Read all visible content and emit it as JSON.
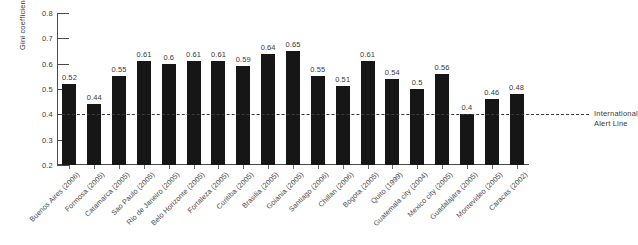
{
  "chart_data": {
    "type": "bar",
    "title": "",
    "subtitle": "",
    "xlabel": "",
    "ylabel": "Gini coefficient",
    "ylim": [
      0.2,
      0.8
    ],
    "yticks": [
      "0.8",
      "0.7",
      "0.6",
      "0.5",
      "0.4",
      "0.3",
      "0.2"
    ],
    "ytick_values": [
      0.8,
      0.7,
      0.6,
      0.5,
      0.4,
      0.3,
      0.2
    ],
    "grid": false,
    "legend": "none",
    "bar_color": "#161616",
    "categories": [
      "Buenos Aires (2006)",
      "Formosa (2005)",
      "Catamarca (2005)",
      "Sao Paulo (2005)",
      "Rio de Janeiro (2005)",
      "Belo Horizonte (2005)",
      "Fortaleza (2005)",
      "Curitiba (2005)",
      "Brasilia (2005)",
      "Goiania (2005)",
      "Santiago (2006)",
      "Chillan (2006)",
      "Bogota (2005)",
      "Quito (1999)",
      "Guatemala city (2004)",
      "Mexico city (2005)",
      "Guadalajara (2005)",
      "Montevideo (2005)",
      "Caracas (2002)"
    ],
    "values": [
      0.52,
      0.44,
      0.55,
      0.61,
      0.6,
      0.61,
      0.61,
      0.59,
      0.64,
      0.65,
      0.55,
      0.51,
      0.61,
      0.54,
      0.5,
      0.56,
      0.4,
      0.46,
      0.48
    ],
    "value_labels": [
      "0.52",
      "0.44",
      "0.55",
      "0.61",
      "0.6",
      "0.61",
      "0.61",
      "0.59",
      "0.64",
      "0.65",
      "0.55",
      "0.51",
      "0.61",
      "0.54",
      "0.5",
      "0.56",
      "0.4",
      "0.46",
      "0.48"
    ],
    "annotations": [
      {
        "name": "international-alert-line",
        "value": 0.4,
        "label_line1": "International",
        "label_line2": "Alert Line",
        "style": "dashed",
        "color": "#3a3a3a"
      }
    ]
  }
}
